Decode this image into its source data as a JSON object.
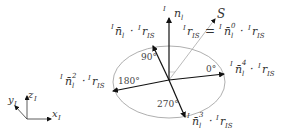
{
  "diagram": {
    "type": "vector-projection-diagram",
    "colors": {
      "arrow": "#111111",
      "ellipse": "#999999",
      "s_line": "#aaaaaa",
      "text": "#333333"
    },
    "normal": {
      "sup": "I",
      "base": "n",
      "sub": "l"
    },
    "sun_label": "S",
    "top_left_expr": {
      "sup1": "I",
      "base1": "n̄",
      "sub1": "l",
      "dot": "·",
      "sup2": "I",
      "base2": "r",
      "sub2": "IS"
    },
    "top_mid_expr": {
      "sup": "I",
      "base": "r",
      "sub": "IS",
      "eq": "="
    },
    "top_right_expr": {
      "sup1": "I",
      "base1": "n̄",
      "sub1": "l",
      "sup1b": "0",
      "dot": "·",
      "sup2": "I",
      "base2": "r",
      "sub2": "IS"
    },
    "right_expr": {
      "sup1": "I",
      "base1": "n̄",
      "sub1": "l",
      "sup1b": "4",
      "dot": "·",
      "sup2": "I",
      "base2": "r",
      "sub2": "IS"
    },
    "left_expr": {
      "sup1": "I",
      "base1": "n̄",
      "sub1": "l",
      "sup1b": "2",
      "dot": "·",
      "sup2": "I",
      "base2": "r",
      "sub2": "IS"
    },
    "bottom_expr": {
      "sup1": "I",
      "base1": "n̄",
      "sub1": "l",
      "sup1b": "3",
      "dot": "·",
      "sup2": "I",
      "base2": "r",
      "sub2": "IS"
    },
    "angles": [
      "0°",
      "90°",
      "180°",
      "270°"
    ],
    "axes": {
      "x": {
        "base": "x",
        "sub": "I"
      },
      "y": {
        "base": "y",
        "sub": "I"
      },
      "z": {
        "base": "z",
        "sub": "I"
      }
    }
  }
}
